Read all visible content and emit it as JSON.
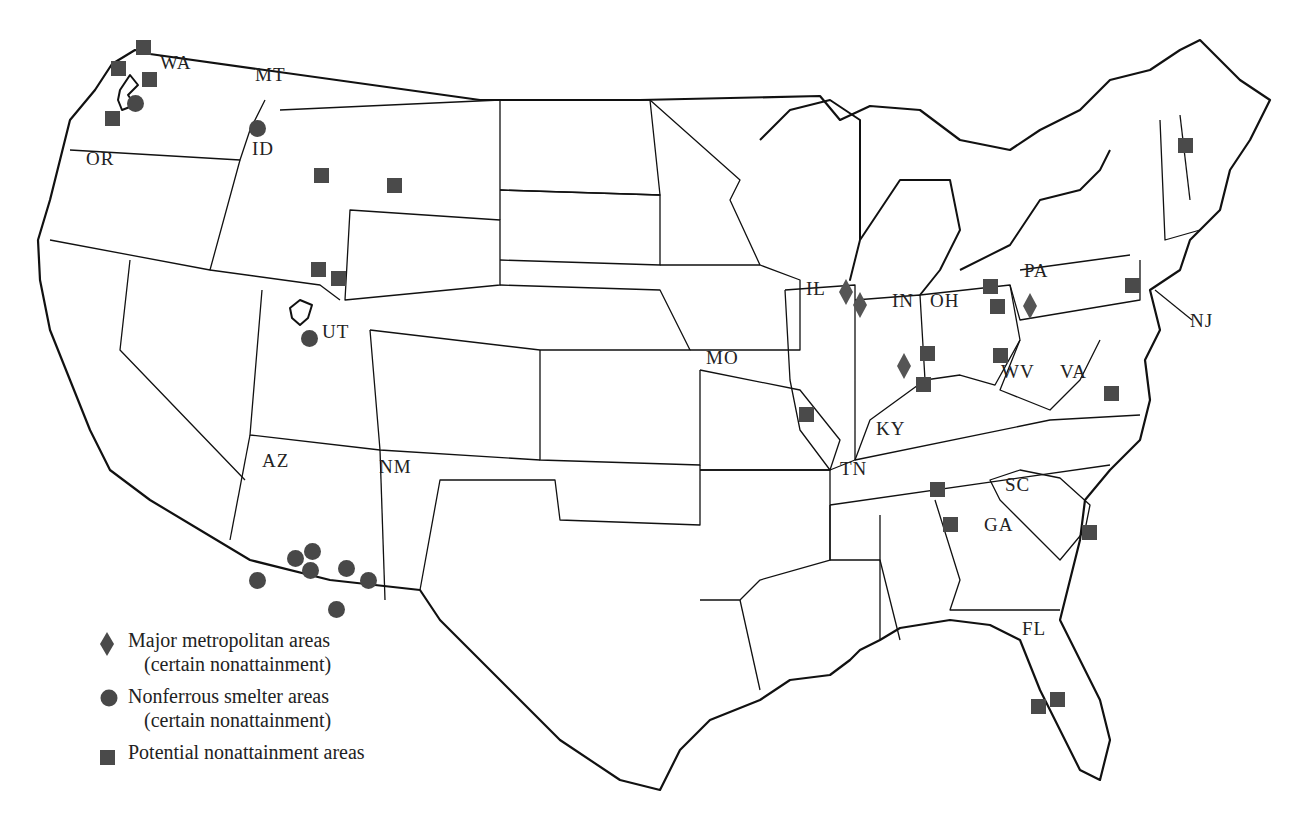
{
  "map": {
    "title": "Potential and certain nonattainment areas",
    "state_labels": [
      {
        "code": "WA",
        "x": 160,
        "y": 64
      },
      {
        "code": "MT",
        "x": 255,
        "y": 76
      },
      {
        "code": "ID",
        "x": 252,
        "y": 150
      },
      {
        "code": "OR",
        "x": 86,
        "y": 160
      },
      {
        "code": "UT",
        "x": 322,
        "y": 333
      },
      {
        "code": "AZ",
        "x": 262,
        "y": 462
      },
      {
        "code": "NM",
        "x": 379,
        "y": 468
      },
      {
        "code": "MO",
        "x": 706,
        "y": 359
      },
      {
        "code": "IL",
        "x": 806,
        "y": 290
      },
      {
        "code": "IN",
        "x": 892,
        "y": 302
      },
      {
        "code": "OH",
        "x": 930,
        "y": 302
      },
      {
        "code": "PA",
        "x": 1024,
        "y": 272
      },
      {
        "code": "NJ",
        "x": 1190,
        "y": 322
      },
      {
        "code": "WV",
        "x": 1001,
        "y": 373
      },
      {
        "code": "VA",
        "x": 1060,
        "y": 373
      },
      {
        "code": "KY",
        "x": 876,
        "y": 430
      },
      {
        "code": "TN",
        "x": 840,
        "y": 470
      },
      {
        "code": "SC",
        "x": 1005,
        "y": 486
      },
      {
        "code": "GA",
        "x": 984,
        "y": 526
      },
      {
        "code": "FL",
        "x": 1022,
        "y": 630
      }
    ],
    "markers": {
      "metropolitan": [
        {
          "x": 846,
          "y": 292
        },
        {
          "x": 860,
          "y": 305
        },
        {
          "x": 904,
          "y": 366
        },
        {
          "x": 1030,
          "y": 306
        }
      ],
      "smelter": [
        {
          "x": 135,
          "y": 103
        },
        {
          "x": 257,
          "y": 128
        },
        {
          "x": 309,
          "y": 338
        },
        {
          "x": 295,
          "y": 558
        },
        {
          "x": 312,
          "y": 551
        },
        {
          "x": 310,
          "y": 570
        },
        {
          "x": 346,
          "y": 568
        },
        {
          "x": 368,
          "y": 580
        },
        {
          "x": 257,
          "y": 580
        },
        {
          "x": 336,
          "y": 609
        }
      ],
      "potential": [
        {
          "x": 143,
          "y": 47
        },
        {
          "x": 118,
          "y": 68
        },
        {
          "x": 149,
          "y": 79
        },
        {
          "x": 112,
          "y": 118
        },
        {
          "x": 321,
          "y": 175
        },
        {
          "x": 394,
          "y": 185
        },
        {
          "x": 318,
          "y": 269
        },
        {
          "x": 338,
          "y": 278
        },
        {
          "x": 990,
          "y": 286
        },
        {
          "x": 997,
          "y": 306
        },
        {
          "x": 927,
          "y": 353
        },
        {
          "x": 1000,
          "y": 355
        },
        {
          "x": 923,
          "y": 384
        },
        {
          "x": 806,
          "y": 414
        },
        {
          "x": 1132,
          "y": 285
        },
        {
          "x": 1111,
          "y": 393
        },
        {
          "x": 937,
          "y": 489
        },
        {
          "x": 950,
          "y": 524
        },
        {
          "x": 1089,
          "y": 532
        },
        {
          "x": 1185,
          "y": 145
        },
        {
          "x": 1038,
          "y": 706
        },
        {
          "x": 1057,
          "y": 699
        }
      ]
    }
  },
  "legend": {
    "items": [
      {
        "symbol": "diamond-icon",
        "label": "Major metropolitan areas",
        "sublabel": "(certain nonattainment)"
      },
      {
        "symbol": "circle-icon",
        "label": "Nonferrous smelter areas",
        "sublabel": "(certain nonattainment)"
      },
      {
        "symbol": "square-icon",
        "label": "Potential nonattainment areas",
        "sublabel": ""
      }
    ]
  },
  "colors": {
    "marker": "#4a4a4a",
    "outline": "#111111",
    "background": "#ffffff"
  }
}
